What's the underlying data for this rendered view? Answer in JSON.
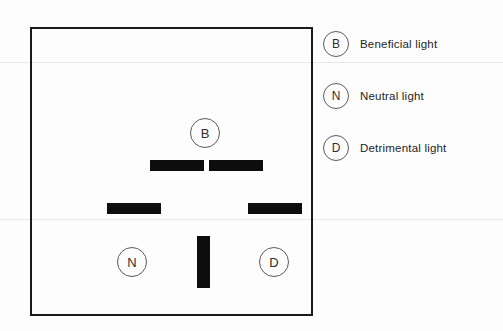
{
  "figure": {
    "title": "",
    "frame": {
      "border_color": "#1a1a1a",
      "background": "#ffffff"
    },
    "markers": [
      {
        "key": "B",
        "letter": "B",
        "name": "beneficial",
        "x": 173,
        "y": 104
      },
      {
        "key": "N",
        "letter": "N",
        "name": "neutral",
        "x": 100,
        "y": 233
      },
      {
        "key": "D",
        "letter": "D",
        "name": "detrimental",
        "x": 242,
        "y": 233
      }
    ],
    "bars": [
      {
        "name": "bar-top-left",
        "orientation": "horizontal",
        "x": 118,
        "y": 131,
        "w": 54,
        "h": 11,
        "color": "#0d0d0d"
      },
      {
        "name": "bar-top-right",
        "orientation": "horizontal",
        "x": 177,
        "y": 131,
        "w": 54,
        "h": 11,
        "color": "#0d0d0d"
      },
      {
        "name": "bar-mid-left",
        "orientation": "horizontal",
        "x": 75,
        "y": 174,
        "w": 54,
        "h": 11,
        "color": "#0d0d0d"
      },
      {
        "name": "bar-mid-right",
        "orientation": "horizontal",
        "x": 216,
        "y": 174,
        "w": 54,
        "h": 11,
        "color": "#0d0d0d"
      },
      {
        "name": "bar-vertical",
        "orientation": "vertical",
        "x": 165,
        "y": 207,
        "w": 13,
        "h": 52,
        "color": "#0d0d0d"
      }
    ]
  },
  "legend": {
    "items": [
      {
        "symbol": "B",
        "label": "Beneficial light"
      },
      {
        "symbol": "N",
        "label": "Neutral light"
      },
      {
        "symbol": "D",
        "label": "Detrimental light"
      }
    ]
  },
  "colors": {
    "bar_fill": "#0d0d0d",
    "frame_stroke": "#1a1a1a",
    "marker_stroke": "#5a5a5a",
    "text": "#1f1f1f"
  }
}
